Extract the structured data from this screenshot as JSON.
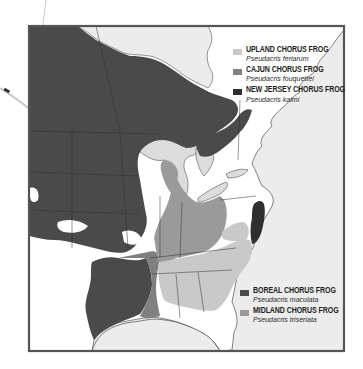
{
  "map": {
    "region": "Eastern and Central North America",
    "colors": {
      "background": "#ffffff",
      "water": "#ececec",
      "frame": "#555555",
      "boundary": "#2e2e2e",
      "unoccupied_land": "#ffffff"
    }
  },
  "legend_top": {
    "items": [
      {
        "common_name": "UPLAND CHORUS FROG",
        "latin_name": "Pseudacris feriarum",
        "color": "#c9c9c9"
      },
      {
        "common_name": "CAJUN CHORUS FROG",
        "latin_name": "Pseudacris fouquettei",
        "color": "#808080"
      },
      {
        "common_name": "NEW JERSEY CHORUS FROG",
        "latin_name": "Pseudacris kalmi",
        "color": "#2f2f2f"
      }
    ]
  },
  "legend_bottom": {
    "items": [
      {
        "common_name": "BOREAL CHORUS FROG",
        "latin_name": "Pseudacris maculata",
        "color": "#4a4a4a"
      },
      {
        "common_name": "MIDLAND CHORUS FROG",
        "latin_name": "Pseudacris triseriata",
        "color": "#9a9a9a"
      }
    ]
  }
}
